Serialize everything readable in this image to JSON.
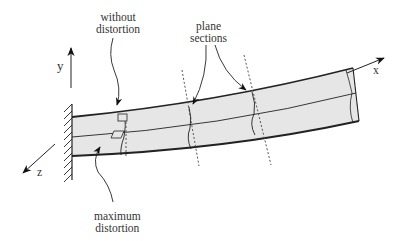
{
  "diagram": {
    "type": "cantilever beam bending with shear distortion",
    "labels": {
      "without_distortion_line1": "without",
      "without_distortion_line2": "distortion",
      "plane_sections_line1": "plane",
      "plane_sections_line2": "sections",
      "maximum_distortion_line1": "maximum",
      "maximum_distortion_line2": "distortion"
    },
    "axes": {
      "x": "x",
      "y": "y",
      "z": "z"
    },
    "colors": {
      "beam_fill": "#e6e6e6",
      "stroke": "#222222",
      "dotted": "#555555"
    }
  }
}
